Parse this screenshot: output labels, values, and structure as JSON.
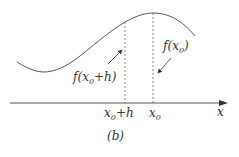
{
  "figure": {
    "caption": "(b)",
    "axis_label": "x",
    "curve_label_peak": {
      "func": "f(",
      "var": "x",
      "sub": "0",
      "close": ")"
    },
    "curve_label_step": {
      "func": "f(",
      "var": "x",
      "sub": "0",
      "rest": "+h)"
    },
    "tick_label_step": {
      "var": "x",
      "sub": "0",
      "rest": "+h"
    },
    "tick_label_peak": {
      "var": "x",
      "sub": "0"
    },
    "colors": {
      "stroke": "#555555",
      "text": "#333333"
    }
  }
}
